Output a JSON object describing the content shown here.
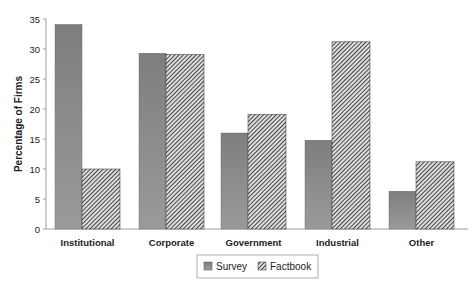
{
  "chart_data": {
    "type": "bar",
    "title": "",
    "xlabel": "",
    "ylabel": "Percentage of Firms",
    "ylim": [
      0,
      35
    ],
    "yticks": [
      0,
      5,
      10,
      15,
      20,
      25,
      30,
      35
    ],
    "grid": false,
    "legend_position": "bottom",
    "categories": [
      "Institutional",
      "Corporate",
      "Government",
      "Industrial",
      "Other"
    ],
    "series": [
      {
        "name": "Survey",
        "values": [
          34.1,
          29.3,
          16.0,
          14.8,
          6.3
        ],
        "fill": "#8a8a8a",
        "pattern": "solid"
      },
      {
        "name": "Factbook",
        "values": [
          10.0,
          29.1,
          19.1,
          31.2,
          11.2
        ],
        "fill": "#555555",
        "pattern": "diagonal-hatch"
      }
    ]
  }
}
